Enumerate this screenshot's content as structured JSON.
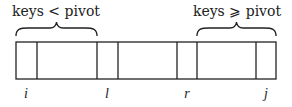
{
  "diagram": {
    "type": "array-partition",
    "labels": {
      "left_region": "keys < pivot",
      "right_region": "keys ⩾ pivot"
    },
    "indices": [
      {
        "name": "i",
        "x": 26
      },
      {
        "name": "l",
        "x": 107
      },
      {
        "name": "r",
        "x": 187
      },
      {
        "name": "j",
        "x": 266
      }
    ],
    "array_box": {
      "x0": 16,
      "x1": 276,
      "y0": 42,
      "y1": 79
    },
    "dividers_x": [
      37,
      97,
      118,
      177,
      197,
      256
    ],
    "braces": [
      {
        "id": "left",
        "x0": 16,
        "x1": 97,
        "label": "keys < pivot"
      },
      {
        "id": "right",
        "x0": 197,
        "x1": 276,
        "label": "keys ⩾ pivot"
      }
    ],
    "colors": {
      "ink": "#222222",
      "background": "#ffffff"
    }
  }
}
